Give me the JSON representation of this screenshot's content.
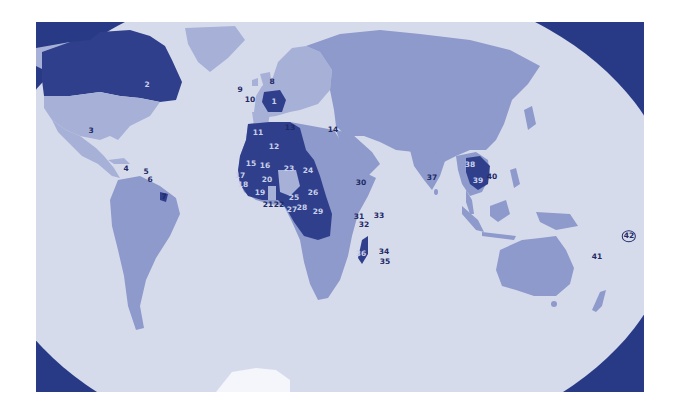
{
  "map": {
    "colors": {
      "frame_background": "#283a86",
      "ocean": "#d6dbec",
      "land_default": "#8d9acb",
      "land_light": "#a7b1d8",
      "land_highlight": "#2f3f8c",
      "antarctica": "#f4f6fb"
    },
    "legend_note": "Numbered countries and territories",
    "markers": [
      {
        "id": "1",
        "x": 274,
        "y": 102,
        "style": "light"
      },
      {
        "id": "2",
        "x": 147,
        "y": 85,
        "style": "light"
      },
      {
        "id": "3",
        "x": 91,
        "y": 131,
        "style": "dark"
      },
      {
        "id": "4",
        "x": 126,
        "y": 169,
        "style": "dark"
      },
      {
        "id": "5",
        "x": 146,
        "y": 172,
        "style": "dark"
      },
      {
        "id": "6",
        "x": 150,
        "y": 180,
        "style": "dark"
      },
      {
        "id": "7",
        "x": 164,
        "y": 197,
        "style": "dark"
      },
      {
        "id": "8",
        "x": 272,
        "y": 82,
        "style": "dark"
      },
      {
        "id": "9",
        "x": 240,
        "y": 90,
        "style": "dark"
      },
      {
        "id": "10",
        "x": 250,
        "y": 100,
        "style": "dark"
      },
      {
        "id": "11",
        "x": 258,
        "y": 133,
        "style": "light"
      },
      {
        "id": "12",
        "x": 274,
        "y": 147,
        "style": "light"
      },
      {
        "id": "13",
        "x": 290,
        "y": 128,
        "style": "dark"
      },
      {
        "id": "14",
        "x": 333,
        "y": 130,
        "style": "dark"
      },
      {
        "id": "15",
        "x": 251,
        "y": 164,
        "style": "light"
      },
      {
        "id": "16",
        "x": 265,
        "y": 166,
        "style": "light"
      },
      {
        "id": "17",
        "x": 240,
        "y": 176,
        "style": "light"
      },
      {
        "id": "18",
        "x": 243,
        "y": 185,
        "style": "light"
      },
      {
        "id": "19",
        "x": 260,
        "y": 193,
        "style": "light"
      },
      {
        "id": "20",
        "x": 267,
        "y": 180,
        "style": "light"
      },
      {
        "id": "21",
        "x": 268,
        "y": 205,
        "style": "dark"
      },
      {
        "id": "22",
        "x": 279,
        "y": 205,
        "style": "dark"
      },
      {
        "id": "23",
        "x": 289,
        "y": 169,
        "style": "light"
      },
      {
        "id": "24",
        "x": 308,
        "y": 171,
        "style": "light"
      },
      {
        "id": "25",
        "x": 294,
        "y": 198,
        "style": "light"
      },
      {
        "id": "26",
        "x": 313,
        "y": 193,
        "style": "light"
      },
      {
        "id": "27",
        "x": 292,
        "y": 210,
        "style": "light"
      },
      {
        "id": "28",
        "x": 302,
        "y": 208,
        "style": "light"
      },
      {
        "id": "29",
        "x": 318,
        "y": 212,
        "style": "light"
      },
      {
        "id": "30",
        "x": 361,
        "y": 183,
        "style": "dark"
      },
      {
        "id": "31",
        "x": 359,
        "y": 217,
        "style": "dark"
      },
      {
        "id": "32",
        "x": 364,
        "y": 225,
        "style": "dark"
      },
      {
        "id": "33",
        "x": 379,
        "y": 216,
        "style": "dark"
      },
      {
        "id": "34",
        "x": 384,
        "y": 252,
        "style": "dark"
      },
      {
        "id": "35",
        "x": 385,
        "y": 262,
        "style": "dark"
      },
      {
        "id": "36",
        "x": 361,
        "y": 254,
        "style": "light"
      },
      {
        "id": "37",
        "x": 432,
        "y": 178,
        "style": "dark"
      },
      {
        "id": "38",
        "x": 470,
        "y": 165,
        "style": "light"
      },
      {
        "id": "39",
        "x": 478,
        "y": 181,
        "style": "light"
      },
      {
        "id": "40",
        "x": 492,
        "y": 177,
        "style": "dark"
      },
      {
        "id": "41",
        "x": 597,
        "y": 257,
        "style": "dark"
      },
      {
        "id": "42",
        "x": 629,
        "y": 236,
        "style": "circled"
      }
    ]
  }
}
